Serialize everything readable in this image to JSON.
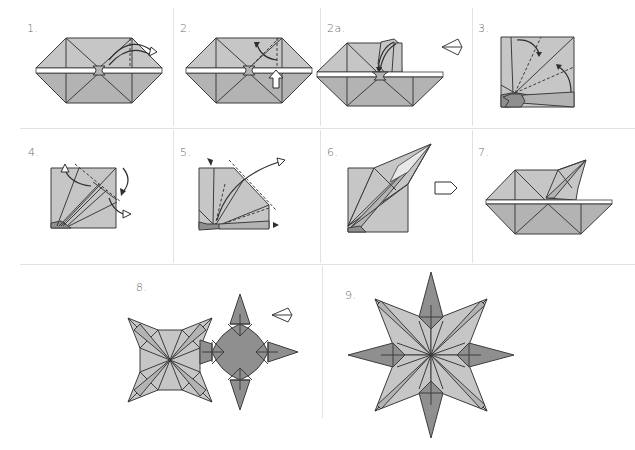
{
  "diagram": {
    "type": "origami-instructions",
    "colors": {
      "paper_light": "#c6c6c6",
      "paper_mid": "#b2b2b2",
      "paper_dark": "#8f8f8f",
      "stroke": "#3c3c3c",
      "divider": "#e2e2e2",
      "label": "#6a6a6a"
    },
    "steps": [
      {
        "label": "1.",
        "description": "base with valley fold arrow on right flap"
      },
      {
        "label": "2.",
        "description": "squash fold with push arrow"
      },
      {
        "label": "2a.",
        "description": "flap being lifted, leads to next view"
      },
      {
        "label": "3.",
        "description": "close-up: fold edges to dashed lines"
      },
      {
        "label": "4.",
        "description": "petal fold with arrows"
      },
      {
        "label": "5.",
        "description": "inside reverse fold, swing point over"
      },
      {
        "label": "6.",
        "description": "completed point, then repeat"
      },
      {
        "label": "7.",
        "description": "one point finished on base"
      },
      {
        "label": "8.",
        "description": "two finished units, join together"
      },
      {
        "label": "9.",
        "description": "finished eight-pointed star"
      }
    ]
  }
}
